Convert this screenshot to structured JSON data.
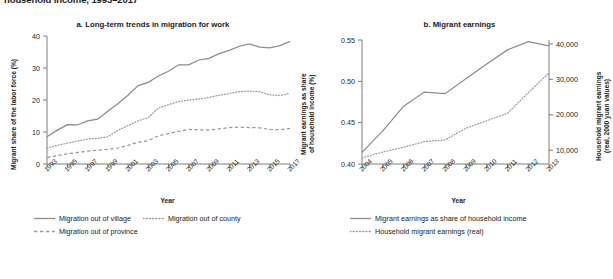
{
  "figure": {
    "top_title": "household income, 1993–2017",
    "panels": [
      {
        "id": "a",
        "title": "a. Long-term trends in migration for work"
      },
      {
        "id": "b",
        "title": "b. Migrant earnings"
      }
    ]
  },
  "chart_data": [
    {
      "type": "line",
      "panel": "a",
      "title": "a. Long-term trends in migration for work",
      "xlabel": "Year",
      "ylabel": "Migrant share of the labor force (%)",
      "ylabel_right": "Migrant earnings as share of household income (%)",
      "xlim": [
        1993,
        2017
      ],
      "ylim": [
        0,
        40
      ],
      "yticks": [
        0,
        10,
        20,
        30,
        40
      ],
      "xticks": [
        "1993",
        "1995",
        "1997",
        "1999",
        "2001",
        "2003",
        "2005",
        "2007",
        "2009",
        "2011",
        "2013",
        "2015",
        "2017"
      ],
      "grid": false,
      "legend_position": "bottom-left",
      "x": [
        1993,
        1994,
        1995,
        1996,
        1997,
        1998,
        1999,
        2000,
        2001,
        2002,
        2003,
        2004,
        2005,
        2006,
        2007,
        2008,
        2009,
        2010,
        2011,
        2012,
        2013,
        2014,
        2015,
        2016,
        2017
      ],
      "series": [
        {
          "name": "Migration out of village",
          "style": "solid",
          "color": "#8c8c8c",
          "values": [
            8.5,
            10.5,
            12.3,
            12.2,
            13.5,
            14.0,
            16.5,
            18.8,
            21.5,
            24.5,
            25.5,
            27.5,
            29.0,
            31.0,
            31.0,
            32.5,
            33.0,
            34.5,
            35.5,
            36.8,
            37.5,
            36.5,
            36.3,
            37.0,
            38.3
          ]
        },
        {
          "name": "Migration out of county",
          "style": "dotted",
          "color": "#9a9a9a",
          "values": [
            5.0,
            5.8,
            6.5,
            7.2,
            7.8,
            8.0,
            8.5,
            10.5,
            12.0,
            13.5,
            14.5,
            17.5,
            18.5,
            19.5,
            20.0,
            20.3,
            20.8,
            21.5,
            22.0,
            22.6,
            22.8,
            22.6,
            21.6,
            21.4,
            22.1
          ]
        },
        {
          "name": "Migration out of province",
          "style": "dashed",
          "color": "#9a9a9a",
          "values": [
            2.0,
            2.6,
            3.2,
            3.6,
            4.0,
            4.3,
            4.6,
            5.0,
            5.8,
            6.8,
            7.3,
            8.8,
            9.5,
            10.2,
            10.8,
            10.7,
            10.6,
            11.0,
            11.4,
            11.5,
            11.4,
            11.3,
            10.8,
            10.7,
            11.1
          ]
        }
      ]
    },
    {
      "type": "line",
      "panel": "b",
      "title": "b. Migrant earnings",
      "xlabel": "Year",
      "ylabel": "Migrant earnings as share of household income (%)",
      "ylabel_right": "Household migrant earnings (real, 2000 yuan values)",
      "xlim": [
        2004,
        2013
      ],
      "ylim": [
        0.4,
        0.55
      ],
      "yticks": [
        "0.40",
        "0.45",
        "0.50",
        "0.55"
      ],
      "ylim_right": [
        6500,
        41500
      ],
      "yticks_right": [
        "10,000",
        "20,000",
        "30,000",
        "40,000"
      ],
      "xticks": [
        "2004",
        "2005",
        "2006",
        "2007",
        "2008",
        "2009",
        "2010",
        "2011",
        "2012",
        "2013"
      ],
      "grid": false,
      "legend_position": "bottom-left",
      "x": [
        2004,
        2005,
        2006,
        2007,
        2008,
        2009,
        2010,
        2011,
        2012,
        2013
      ],
      "series": [
        {
          "name": "Migrant earnings as share of household income",
          "style": "solid",
          "color": "#8c8c8c",
          "axis": "left",
          "values": [
            0.414,
            0.44,
            0.47,
            0.487,
            0.485,
            0.503,
            0.521,
            0.538,
            0.548,
            0.543
          ]
        },
        {
          "name": "Household migrant earnings (real)",
          "style": "dotted",
          "color": "#9a9a9a",
          "axis": "right",
          "values": [
            8200,
            9900,
            11200,
            12800,
            13300,
            16600,
            18700,
            20800,
            26600,
            32200
          ]
        }
      ]
    }
  ],
  "panel_a": {
    "title": "a. Long-term trends in migration for work",
    "y_axis_title": "Migrant share of the labor force (%)",
    "x_axis_title": "Year",
    "y_ticks": [
      "40",
      "30",
      "20",
      "10",
      "0"
    ],
    "x_ticks": [
      "1993",
      "1995",
      "1997",
      "1999",
      "2001",
      "2003",
      "2005",
      "2007",
      "2009",
      "2011",
      "2013",
      "2015",
      "2017"
    ],
    "legend": [
      {
        "label": "Migration out of village",
        "style": "solid"
      },
      {
        "label": "Migration out of county",
        "style": "dotted"
      },
      {
        "label": "Migration out of province",
        "style": "dashed"
      }
    ]
  },
  "panel_b": {
    "title": "b. Migrant earnings",
    "y_axis_title_left": "Migrant earnings as share\nof household income (%)",
    "y_axis_title_left_line1": "Migrant earnings as share",
    "y_axis_title_left_line2": "of household income (%)",
    "y_axis_title_right_line1": "Household migrant earnings",
    "y_axis_title_right_line2": "(real, 2000 yuan values)",
    "x_axis_title": "Year",
    "y_ticks_left": [
      "0.55",
      "0.50",
      "0.45",
      "0.40"
    ],
    "y_ticks_right": [
      "40,000",
      "30,000",
      "20,000",
      "10,000"
    ],
    "x_ticks": [
      "2004",
      "2005",
      "2006",
      "2007",
      "2008",
      "2009",
      "2010",
      "2011",
      "2012",
      "2013"
    ],
    "legend": [
      {
        "label": "Migrant earnings as share of household income",
        "style": "solid"
      },
      {
        "label": "Household migrant earnings (real)",
        "style": "dotted"
      }
    ]
  },
  "colors": {
    "line": "#8c8c8c",
    "axis": "#6f6f6f",
    "text": "#231f20"
  }
}
